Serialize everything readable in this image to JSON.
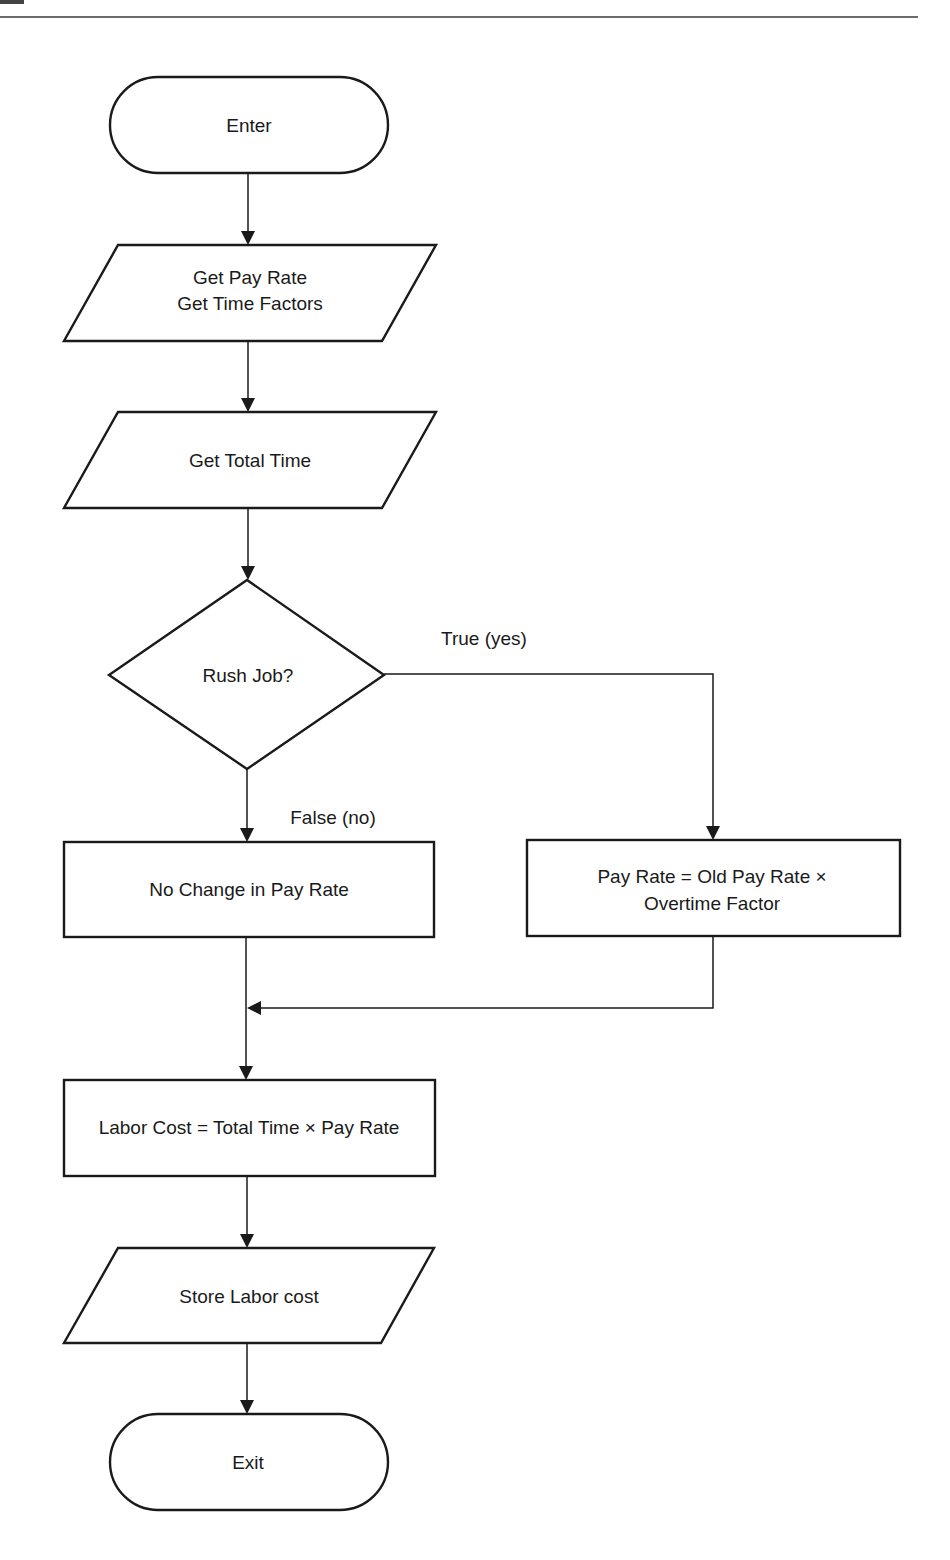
{
  "header": {
    "rule_color": "#6b6b6b"
  },
  "diagram": {
    "type": "flowchart",
    "nodes": {
      "enter": {
        "shape": "terminator",
        "label": "Enter"
      },
      "get_pay": {
        "shape": "input-output",
        "lines": [
          "Get Pay Rate",
          "Get Time Factors"
        ]
      },
      "get_total": {
        "shape": "input-output",
        "label": "Get Total Time"
      },
      "rush": {
        "shape": "decision",
        "label": "Rush Job?"
      },
      "no_change": {
        "shape": "process",
        "label": "No Change in Pay Rate"
      },
      "overtime": {
        "shape": "process",
        "lines": [
          "Pay Rate = Old Pay Rate ×",
          "Overtime Factor"
        ]
      },
      "labor": {
        "shape": "process",
        "label": "Labor Cost = Total Time × Pay Rate"
      },
      "store": {
        "shape": "input-output",
        "label": "Store Labor cost"
      },
      "exit": {
        "shape": "terminator",
        "label": "Exit"
      }
    },
    "edges": {
      "true_label": "True (yes)",
      "false_label": "False (no)"
    },
    "stroke_color": "#1a1a1a"
  }
}
